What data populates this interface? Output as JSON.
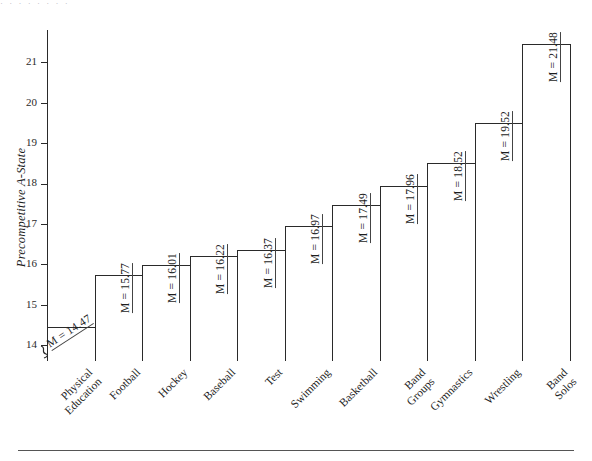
{
  "figure": {
    "caption_remnant": "· · · · · · · ·",
    "bottom_rule": true
  },
  "chart_data": {
    "type": "bar",
    "title": "",
    "xlabel": "",
    "ylabel": "Precompetitive A-State",
    "ylim": [
      13.6,
      21.4
    ],
    "yticks": [
      14,
      15,
      16,
      17,
      18,
      19,
      20,
      21
    ],
    "ytick_labels": [
      "14",
      "15",
      "16",
      "17",
      "18",
      "19",
      "20",
      "21"
    ],
    "axis_break": true,
    "grid": false,
    "legend": "none",
    "categories": [
      "Physical Education",
      "Football",
      "Hockey",
      "Baseball",
      "Test",
      "Swimming",
      "Basketball",
      "Band Groups",
      "Gymnastics",
      "Wrestling",
      "Band Solos"
    ],
    "category_lines": [
      [
        "Physical",
        "Education"
      ],
      [
        "Football"
      ],
      [
        "Hockey"
      ],
      [
        "Baseball"
      ],
      [
        "Test"
      ],
      [
        "Swimming"
      ],
      [
        "Basketball"
      ],
      [
        "Band",
        "Groups"
      ],
      [
        "Gymnastics"
      ],
      [
        "Wrestling"
      ],
      [
        "Band",
        "Solos"
      ]
    ],
    "values": [
      14.47,
      15.77,
      16.01,
      16.22,
      16.37,
      16.97,
      17.49,
      17.96,
      18.52,
      19.52,
      21.48
    ],
    "value_labels": [
      "M = 14.47",
      "M = 15.77",
      "M = 16.01",
      "M = 16.22",
      "M = 16.37",
      "M = 16.97",
      "M = 17.49",
      "M = 17.96",
      "M = 18.52",
      "M = 19.52",
      "M = 21.48"
    ]
  },
  "colors": {
    "bar_fill": "#ffffff",
    "bar_stroke": "#2a2a2a",
    "axis": "#2a2a2a",
    "text": "#1d1d1d"
  }
}
